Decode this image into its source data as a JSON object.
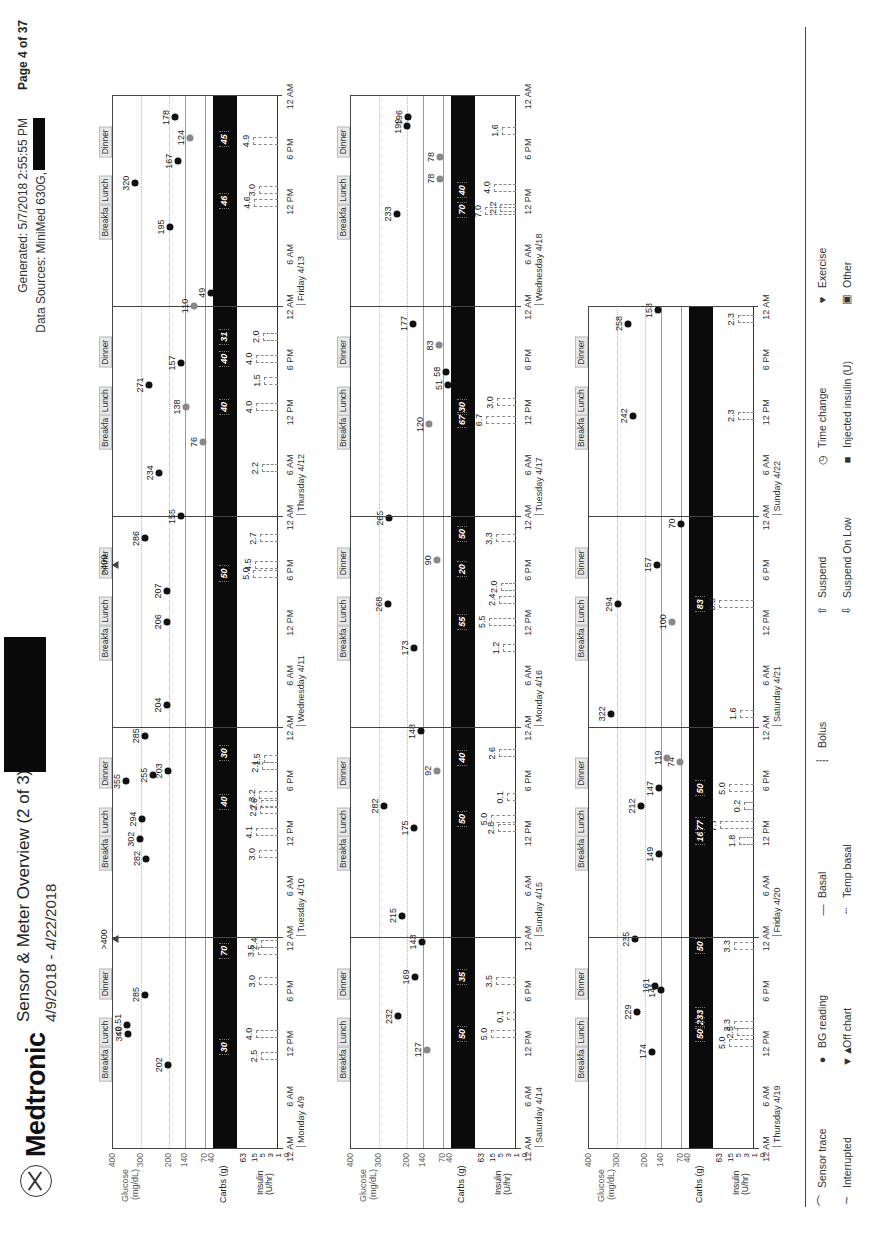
{
  "header": {
    "brand": "Medtronic",
    "title": "Sensor & Meter Overview (2 of 3)",
    "date_range": "4/9/2018 - 4/22/2018",
    "generated": "Generated: 5/7/2018 2:55:55 PM",
    "data_sources": "Data Sources: MiniMed 630G,",
    "page": "Page 4 of 37"
  },
  "axis_labels": {
    "glucose": "Glucose (mg/dL)",
    "carbs": "Carbs (g)",
    "insulin": "Insulin (U/hr)",
    "glucose_ticks": [
      "400",
      "300",
      "200",
      "140",
      "70",
      "40"
    ],
    "carb_tick": "63",
    "insulin_ticks": [
      "15",
      "5",
      "3",
      "1",
      "0"
    ],
    "time_ticks": [
      "12 AM",
      "6 AM",
      "12 PM",
      "6 PM",
      "12 AM"
    ]
  },
  "meal_labels": [
    "Breakfa",
    "Lunch",
    "Dinner"
  ],
  "legend": {
    "items": [
      {
        "icon": "sensor-trace-icon",
        "glyph": "⌒",
        "label": "Sensor trace"
      },
      {
        "icon": "bg-reading-icon",
        "glyph": "●",
        "label": "BG reading"
      },
      {
        "icon": "basal-icon",
        "glyph": "—",
        "label": "Basal"
      },
      {
        "icon": "bolus-icon",
        "glyph": "┊",
        "label": "Bolus"
      },
      {
        "icon": "suspend-icon",
        "glyph": "⇧",
        "label": "Suspend"
      },
      {
        "icon": "time-change-icon",
        "glyph": "◷",
        "label": "Time change"
      },
      {
        "icon": "exercise-icon",
        "glyph": "♥",
        "label": "Exercise"
      },
      {
        "icon": "interrupted-icon",
        "glyph": "∼",
        "label": "Interrupted"
      },
      {
        "icon": "off-chart-icon",
        "glyph": "▼▲",
        "label": "Off chart"
      },
      {
        "icon": "temp-basal-icon",
        "glyph": "┄",
        "label": "Temp basal"
      },
      {
        "icon": "blank",
        "glyph": "",
        "label": ""
      },
      {
        "icon": "suspend-on-low-icon",
        "glyph": "⇩",
        "label": "Suspend On Low"
      },
      {
        "icon": "injected-insulin-icon",
        "glyph": "■",
        "label": "Injected insulin (U)"
      },
      {
        "icon": "other-icon",
        "glyph": "▣",
        "label": "Other"
      }
    ]
  },
  "chart_data": {
    "type": "scatter",
    "title": "Sensor & Meter Overview (2 of 3)",
    "xlabel": "Time of day",
    "ylabel": "Glucose (mg/dL)",
    "ylim": [
      40,
      400
    ],
    "target_range": [
      70,
      140
    ],
    "days": [
      {
        "label": "Monday 4/9",
        "row": 0,
        "col": 0,
        "bg": [
          {
            "t": 9.5,
            "v": 202
          },
          {
            "t": 13,
            "v": 346
          },
          {
            "t": 14,
            "v": 351,
            "text": "<0.51"
          },
          {
            "t": 17.5,
            "v": 285
          },
          {
            "t": 23.8,
            "v": 400,
            "text": ">400",
            "offchart": true
          }
        ],
        "carbs": [
          {
            "t": 11.5,
            "v": 30
          },
          {
            "t": 22.5,
            "v": 70
          }
        ],
        "bolus": [
          {
            "t": 10.5,
            "v": 2.5
          },
          {
            "t": 13,
            "v": 4.0
          },
          {
            "t": 19,
            "v": 3.0
          },
          {
            "t": 22.5,
            "v": 3.5
          },
          {
            "t": 23.3,
            "v": 2.4
          }
        ]
      },
      {
        "label": "Tuesday 4/10",
        "row": 0,
        "col": 1,
        "bg": [
          {
            "t": 9,
            "v": 282
          },
          {
            "t": 11.2,
            "v": 302
          },
          {
            "t": 13.5,
            "v": 294
          },
          {
            "t": 17.8,
            "v": 355
          },
          {
            "t": 18.5,
            "v": 255
          },
          {
            "t": 19,
            "v": 203
          },
          {
            "t": 23,
            "v": 285
          }
        ],
        "carbs": [
          {
            "t": 15.5,
            "v": 40
          },
          {
            "t": 21,
            "v": 30
          }
        ],
        "bolus": [
          {
            "t": 9.5,
            "v": 3.0
          },
          {
            "t": 12,
            "v": 4.1
          },
          {
            "t": 14.5,
            "v": 2.7
          },
          {
            "t": 15.2,
            "v": 2.6
          },
          {
            "t": 16.2,
            "v": 3.2
          },
          {
            "t": 19.5,
            "v": 2.1
          },
          {
            "t": 20.3,
            "v": 1.5
          }
        ]
      },
      {
        "label": "Wednesday 4/11",
        "row": 0,
        "col": 2,
        "bg": [
          {
            "t": 2.5,
            "v": 204
          },
          {
            "t": 12,
            "v": 206
          },
          {
            "t": 15.5,
            "v": 207
          },
          {
            "t": 18.5,
            "v": 400,
            "text": ">400",
            "offchart": true
          },
          {
            "t": 21.5,
            "v": 286
          }
        ],
        "carbs": [
          {
            "t": 17.5,
            "v": 50
          }
        ],
        "bolus": [
          {
            "t": 17.5,
            "v": 5.0
          },
          {
            "t": 18.5,
            "v": 4.5
          },
          {
            "t": 21.5,
            "v": 2.7
          }
        ]
      },
      {
        "label": "Thursday 4/12",
        "row": 0,
        "col": 3,
        "bg": [
          {
            "t": 0,
            "v": 155
          },
          {
            "t": 5,
            "v": 234
          },
          {
            "t": 8.5,
            "v": 76,
            "grey": true
          },
          {
            "t": 12.5,
            "v": 138,
            "grey": true
          },
          {
            "t": 15,
            "v": 271
          },
          {
            "t": 17.5,
            "v": 157
          }
        ],
        "carbs": [
          {
            "t": 12.5,
            "v": 40
          },
          {
            "t": 18,
            "v": 40
          },
          {
            "t": 20.5,
            "v": 31
          }
        ],
        "bolus": [
          {
            "t": 5.5,
            "v": 2.2
          },
          {
            "t": 12.5,
            "v": 4.0
          },
          {
            "t": 15.5,
            "v": 1.5
          },
          {
            "t": 18,
            "v": 4.0
          },
          {
            "t": 20.5,
            "v": 2.0
          }
        ]
      },
      {
        "label": "Friday 4/13",
        "row": 0,
        "col": 4,
        "bg": [
          {
            "t": 0,
            "v": 110,
            "grey": true
          },
          {
            "t": 1.5,
            "v": 49
          },
          {
            "t": 9,
            "v": 195
          },
          {
            "t": 14,
            "v": 320
          },
          {
            "t": 16.5,
            "v": 167
          },
          {
            "t": 19.2,
            "v": 124,
            "grey": true
          },
          {
            "t": 21.5,
            "v": 178
          }
        ],
        "carbs": [
          {
            "t": 12,
            "v": 46
          },
          {
            "t": 19,
            "v": 45
          }
        ],
        "bolus": [
          {
            "t": 11.8,
            "v": 4.6
          },
          {
            "t": 13.2,
            "v": 3.0
          },
          {
            "t": 18.8,
            "v": 4.9
          }
        ]
      },
      {
        "label": "Saturday 4/14",
        "row": 1,
        "col": 0,
        "bg": [
          {
            "t": 11.2,
            "v": 127,
            "grey": true
          },
          {
            "t": 15,
            "v": 232
          },
          {
            "t": 19.5,
            "v": 169
          },
          {
            "t": 23.5,
            "v": 143
          }
        ],
        "carbs": [
          {
            "t": 13,
            "v": 50
          },
          {
            "t": 19.5,
            "v": 35
          }
        ],
        "bolus": [
          {
            "t": 13,
            "v": 5.0
          },
          {
            "t": 15,
            "v": 0.1
          },
          {
            "t": 19,
            "v": 3.5
          }
        ]
      },
      {
        "label": "Sunday 4/15",
        "row": 1,
        "col": 1,
        "bg": [
          {
            "t": 2.5,
            "v": 215
          },
          {
            "t": 12.5,
            "v": 175
          },
          {
            "t": 15,
            "v": 282
          },
          {
            "t": 19,
            "v": 92,
            "grey": true
          },
          {
            "t": 23.5,
            "v": 148
          }
        ],
        "carbs": [
          {
            "t": 13.5,
            "v": 50
          },
          {
            "t": 20.5,
            "v": 40
          }
        ],
        "bolus": [
          {
            "t": 12.5,
            "v": 2.8
          },
          {
            "t": 13.5,
            "v": 5.0
          },
          {
            "t": 16,
            "v": 0.1
          },
          {
            "t": 21,
            "v": 2.6
          }
        ]
      },
      {
        "label": "Monday 4/16",
        "row": 1,
        "col": 2,
        "bg": [
          {
            "t": 9,
            "v": 173
          },
          {
            "t": 14,
            "v": 268
          },
          {
            "t": 19,
            "v": 90,
            "grey": true
          },
          {
            "t": 23.8,
            "v": 265
          }
        ],
        "carbs": [
          {
            "t": 12,
            "v": 55
          },
          {
            "t": 18,
            "v": 20
          },
          {
            "t": 22,
            "v": 50
          }
        ],
        "bolus": [
          {
            "t": 9,
            "v": 1.2
          },
          {
            "t": 12,
            "v": 5.5
          },
          {
            "t": 14.5,
            "v": 2.4
          },
          {
            "t": 16,
            "v": 2.0
          },
          {
            "t": 21.5,
            "v": 3.3
          }
        ]
      },
      {
        "label": "Tuesday 4/17",
        "row": 1,
        "col": 3,
        "bg": [
          {
            "t": 10.5,
            "v": 120,
            "grey": true
          },
          {
            "t": 15,
            "v": 51
          },
          {
            "t": 16.5,
            "v": 58
          },
          {
            "t": 19.5,
            "v": 83,
            "grey": true
          },
          {
            "t": 22,
            "v": 177
          }
        ],
        "carbs": [
          {
            "t": 11,
            "v": 67
          },
          {
            "t": 12.5,
            "v": 30
          }
        ],
        "bolus": [
          {
            "t": 11,
            "v": 6.7
          },
          {
            "t": 13,
            "v": 3.0
          }
        ]
      },
      {
        "label": "Wednesday 4/18",
        "row": 1,
        "col": 4,
        "bg": [
          {
            "t": 10.5,
            "v": 233
          },
          {
            "t": 14.5,
            "v": 78,
            "grey": true
          },
          {
            "t": 17,
            "v": 78,
            "grey": true
          },
          {
            "t": 20.5,
            "v": 199
          },
          {
            "t": 21.5,
            "v": 196
          }
        ],
        "carbs": [
          {
            "t": 11,
            "v": 70
          },
          {
            "t": 13.2,
            "v": 40
          }
        ],
        "bolus": [
          {
            "t": 10.8,
            "v": 7.0
          },
          {
            "t": 11.2,
            "v": 2.2
          },
          {
            "t": 13.5,
            "v": 4.0
          },
          {
            "t": 20,
            "v": 1.6
          }
        ]
      },
      {
        "label": "Thursday 4/19",
        "row": 2,
        "col": 0,
        "bg": [
          {
            "t": 11,
            "v": 174
          },
          {
            "t": 15.5,
            "v": 229
          },
          {
            "t": 18,
            "v": 141
          },
          {
            "t": 18.5,
            "v": 161
          },
          {
            "t": 23.8,
            "v": 235
          }
        ],
        "carbs": [
          {
            "t": 13,
            "v": 50
          },
          {
            "t": 14.3,
            "v": 2
          },
          {
            "t": 15.2,
            "v": 33
          },
          {
            "t": 23,
            "v": 50
          }
        ],
        "bolus": [
          {
            "t": 12,
            "v": 5.0
          },
          {
            "t": 13.2,
            "v": 2.5
          },
          {
            "t": 14,
            "v": 3.3
          },
          {
            "t": 23,
            "v": 3.3
          }
        ]
      },
      {
        "label": "Friday 4/20",
        "row": 2,
        "col": 1,
        "bg": [
          {
            "t": 9.5,
            "v": 149
          },
          {
            "t": 15,
            "v": 212
          },
          {
            "t": 17,
            "v": 147
          },
          {
            "t": 20,
            "v": 74,
            "grey": true
          },
          {
            "t": 20.5,
            "v": 119,
            "grey": true
          }
        ],
        "carbs": [
          {
            "t": 11.5,
            "v": 16
          },
          {
            "t": 12.8,
            "v": 77
          },
          {
            "t": 17,
            "v": 50
          }
        ],
        "bolus": [
          {
            "t": 11,
            "v": 1.8
          },
          {
            "t": 12.8,
            "v": 7.7
          },
          {
            "t": 15,
            "v": 0.2
          },
          {
            "t": 17,
            "v": 5.0
          }
        ]
      },
      {
        "label": "Saturday 4/21",
        "row": 2,
        "col": 2,
        "bg": [
          {
            "t": 1.5,
            "v": 322
          },
          {
            "t": 12,
            "v": 100,
            "grey": true
          },
          {
            "t": 14,
            "v": 294
          },
          {
            "t": 18.5,
            "v": 157
          },
          {
            "t": 23.2,
            "v": 70
          }
        ],
        "carbs": [
          {
            "t": 14,
            "v": 83
          }
        ],
        "bolus": [
          {
            "t": 1.5,
            "v": 1.6
          },
          {
            "t": 14,
            "v": 8.3
          }
        ]
      },
      {
        "label": "Sunday 4/22",
        "row": 2,
        "col": 3,
        "bg": [
          {
            "t": 11.5,
            "v": 242
          },
          {
            "t": 22,
            "v": 258
          },
          {
            "t": 23.5,
            "v": 153
          }
        ],
        "carbs": [],
        "bolus": [
          {
            "t": 11.5,
            "v": 2.3
          },
          {
            "t": 22.5,
            "v": 2.3
          }
        ]
      }
    ]
  }
}
